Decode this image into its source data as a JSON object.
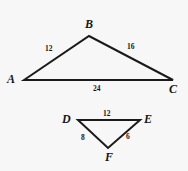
{
  "figure": {
    "background_color": "#f7f7f7",
    "stroke_color": "#1a1a1a",
    "text_color": "#161616",
    "triangles": [
      {
        "name": "triangle-abc",
        "vertices": [
          {
            "label": "A",
            "x": 24,
            "y": 80,
            "label_x": 7,
            "label_y": 73
          },
          {
            "label": "B",
            "x": 89,
            "y": 36,
            "label_x": 85,
            "label_y": 18
          },
          {
            "label": "C",
            "x": 173,
            "y": 80,
            "label_x": 169,
            "label_y": 83
          }
        ],
        "sides": [
          {
            "name": "side-ab",
            "value": "12",
            "label_x": 45,
            "label_y": 45
          },
          {
            "name": "side-bc",
            "value": "16",
            "label_x": 127,
            "label_y": 43
          },
          {
            "name": "side-ac",
            "value": "24",
            "label_x": 93,
            "label_y": 85
          }
        ]
      },
      {
        "name": "triangle-def",
        "vertices": [
          {
            "label": "D",
            "x": 78,
            "y": 120,
            "label_x": 62,
            "label_y": 113
          },
          {
            "label": "E",
            "x": 140,
            "y": 120,
            "label_x": 144,
            "label_y": 113
          },
          {
            "label": "F",
            "x": 108,
            "y": 148,
            "label_x": 105,
            "label_y": 151
          }
        ],
        "sides": [
          {
            "name": "side-de",
            "value": "12",
            "label_x": 103,
            "label_y": 110
          },
          {
            "name": "side-df",
            "value": "8",
            "label_x": 81,
            "label_y": 134
          },
          {
            "name": "side-ef",
            "value": "6",
            "label_x": 126,
            "label_y": 133
          }
        ]
      }
    ]
  }
}
